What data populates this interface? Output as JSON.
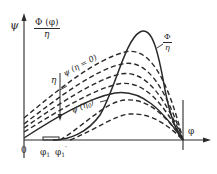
{
  "diagram": {
    "axes": {
      "y_axis_label": "ψ",
      "x_axis_label": "φ",
      "origin_label": "0"
    },
    "labels": {
      "phi_over_eta_numerator": "Φ (φ)",
      "phi_over_eta_denominator": "η",
      "curve_phi_numerator": "Φ",
      "curve_phi_denominator": "η",
      "psi_eta_zero": "ψ (η = 0)",
      "eta_arrow": "η",
      "psi_eta0": "ψ (η",
      "psi_eta0_sub": "0",
      "psi_eta0_close": ")",
      "phi1": "φ",
      "phi1_sub": "1",
      "phi1_prime": "φ",
      "phi1_prime_sub": "1",
      "phi1_prime_mark": "′"
    },
    "colors": {
      "ink": "#2a2a2a",
      "background": "#ffffff"
    }
  }
}
